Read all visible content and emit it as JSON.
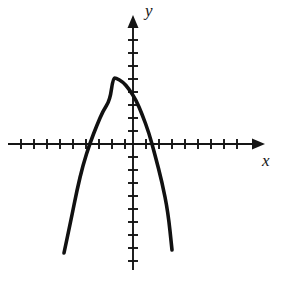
{
  "figure": {
    "kind": "cartesian-plot",
    "width": 281,
    "height": 284,
    "background_color": "#ffffff",
    "ink_color": "#151515",
    "curve_color": "#111111",
    "x_axis_label": "x",
    "y_axis_label": "y"
  },
  "chart_data": {
    "type": "line",
    "title": "",
    "xlabel": "x",
    "ylabel": "y",
    "grid": false,
    "legend": null,
    "axes": {
      "origin_px": [
        133,
        144
      ],
      "unit_px": 13,
      "x_axis_pixel_range": [
        8,
        263
      ],
      "y_axis_pixel_range": [
        16,
        270
      ],
      "x_tick_count": 19,
      "y_tick_count": 18,
      "tick_half_length_px": 5,
      "xlim": [
        -9.6,
        10.0
      ],
      "ylim": [
        -9.7,
        9.8
      ],
      "tick_labels_shown": false
    },
    "curve": {
      "shape": "downward-parabola",
      "equation": "y = -0.47 (x + 1.54)^2 + 5.08",
      "vertex": [
        -1.54,
        5.08
      ],
      "x_intercepts": [
        -3.62,
        1.46
      ],
      "y_intercept": 3.97,
      "leading_coefficient": -0.47,
      "opens": "down",
      "endpoints": [
        [
          -5.31,
          -8.38
        ],
        [
          3.0,
          -8.15
        ]
      ],
      "x": [
        -5.31,
        -4.8,
        -4.3,
        -3.8,
        -3.3,
        -2.8,
        -2.3,
        -1.8,
        -1.54,
        -1.3,
        -0.8,
        -0.3,
        0.2,
        0.7,
        1.2,
        1.7,
        2.2,
        2.7,
        3.0
      ],
      "y": [
        -8.38,
        -5.82,
        -3.56,
        -1.59,
        0.09,
        1.47,
        2.56,
        3.35,
        5.08,
        5.05,
        4.8,
        4.26,
        3.42,
        2.28,
        0.85,
        -0.88,
        -2.9,
        -5.23,
        -8.15
      ],
      "points_px": [
        [
          64,
          253
        ],
        [
          71,
          220
        ],
        [
          77,
          190
        ],
        [
          83,
          165
        ],
        [
          90,
          143
        ],
        [
          97,
          125
        ],
        [
          103,
          111
        ],
        [
          110,
          100
        ],
        [
          113,
          78
        ],
        [
          116,
          78
        ],
        [
          123,
          82
        ],
        [
          129,
          89
        ],
        [
          136,
          100
        ],
        [
          142,
          114
        ],
        [
          149,
          133
        ],
        [
          155,
          155
        ],
        [
          162,
          182
        ],
        [
          168,
          212
        ],
        [
          172,
          250
        ]
      ]
    }
  }
}
